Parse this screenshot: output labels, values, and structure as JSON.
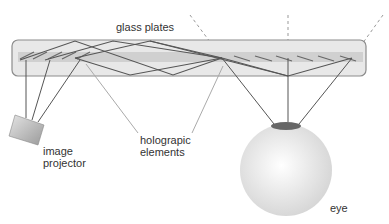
{
  "diagram": {
    "labels": {
      "glass_plates": "glass plates",
      "image_projector_line1": "image",
      "image_projector_line2": "projector",
      "holographic_line1": "holograpic",
      "holographic_line2": "elements",
      "eye": "eye"
    },
    "colors": {
      "plate_fill": "#e6e6e6",
      "plate_stroke": "#8c8c8c",
      "band_fill": "#cfcfcf",
      "ray": "#5a5a5a",
      "dashed": "#888888",
      "pointer": "#a0a0a0",
      "pupil": "#666666",
      "eye_fill": "#e8e8e8"
    }
  }
}
